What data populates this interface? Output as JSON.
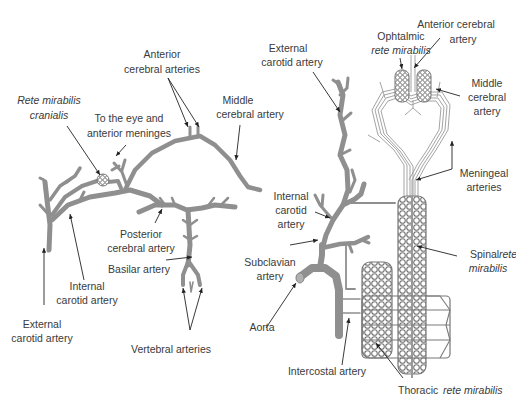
{
  "diagram": {
    "left_panel": {
      "title": "Cranial arterial supply (left)",
      "labels": {
        "rete_cranialis_1": "Rete mirabilis",
        "rete_cranialis_2": "cranialis",
        "eye_1": "To the eye and",
        "eye_2": "anterior meninges",
        "anterior_cerebral_1": "Anterior",
        "anterior_cerebral_2": "cerebral arteries",
        "middle_cerebral_1": "Middle",
        "middle_cerebral_2": "cerebral artery",
        "posterior_cerebral_1": "Posterior",
        "posterior_cerebral_2": "cerebral artery",
        "basilar": "Basilar artery",
        "internal_carotid_1": "Internal",
        "internal_carotid_2": "carotid artery",
        "external_carotid_1": "External",
        "external_carotid_2": "carotid artery",
        "vertebral": "Vertebral arteries"
      }
    },
    "right_panel": {
      "title": "Rete mirabilis system (right)",
      "labels": {
        "external_carotid_1": "External",
        "external_carotid_2": "carotid artery",
        "ophthalmic_1": "Ophtalmic",
        "ophthalmic_2": "rete mirabilis",
        "anterior_cerebral_1": "Anterior cerebral",
        "anterior_cerebral_2": "artery",
        "middle_cerebral_1": "Middle",
        "middle_cerebral_2": "cerebral",
        "middle_cerebral_3": "artery",
        "meningeal_1": "Meningeal",
        "meningeal_2": "arteries",
        "internal_carotid_1": "Internal",
        "internal_carotid_2": "carotid",
        "internal_carotid_3": "artery",
        "spinal_1": "Spinal",
        "spinal_2": "rete",
        "spinal_3": "mirabilis",
        "subclavian_1": "Subclavian",
        "subclavian_2": "artery",
        "aorta": "Aorta",
        "intercostal": "Intercostal artery",
        "thoracic_1": "Thoracic",
        "thoracic_2": "rete mirabilis"
      }
    },
    "colors": {
      "artery": "#8f8f8f",
      "network": "#7a7a7a",
      "text": "#3a3a3a",
      "arrow": "#222222",
      "background": "#ffffff"
    }
  }
}
